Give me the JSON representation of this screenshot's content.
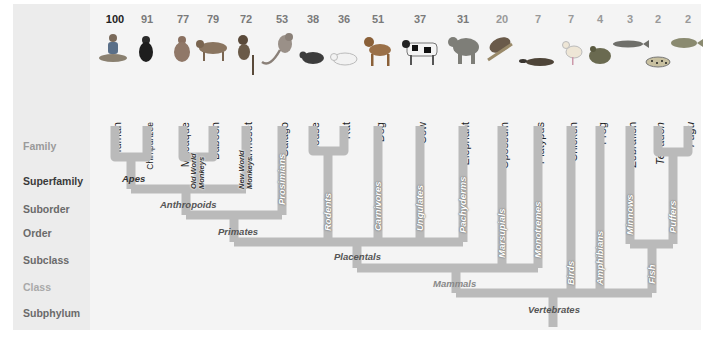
{
  "row_labels": [
    {
      "label": "Family",
      "y": 140,
      "tone": "light-mid"
    },
    {
      "label": "Superfamily",
      "y": 175,
      "tone": "dark"
    },
    {
      "label": "Suborder",
      "y": 203,
      "tone": "mid"
    },
    {
      "label": "Order",
      "y": 227,
      "tone": "mid"
    },
    {
      "label": "Subclass",
      "y": 254,
      "tone": "mid"
    },
    {
      "label": "Class",
      "y": 281,
      "tone": "light"
    },
    {
      "label": "Subphylum",
      "y": 307,
      "tone": "mid"
    }
  ],
  "species": [
    {
      "name": "Human",
      "value": "100",
      "x": 115
    },
    {
      "name": "Chimpanzee",
      "value": "91",
      "x": 147
    },
    {
      "name": "Macaque",
      "value": "77",
      "x": 183
    },
    {
      "name": "Baboon",
      "value": "79",
      "x": 213
    },
    {
      "name": "Marmoset",
      "value": "72",
      "x": 246
    },
    {
      "name": "Galago",
      "value": "53",
      "x": 282
    },
    {
      "name": "Mouse",
      "value": "38",
      "x": 313
    },
    {
      "name": "Rat",
      "value": "36",
      "x": 344
    },
    {
      "name": "Dog",
      "value": "51",
      "x": 378
    },
    {
      "name": "Cow",
      "value": "37",
      "x": 420
    },
    {
      "name": "Elephant",
      "value": "31",
      "x": 463
    },
    {
      "name": "Opossum",
      "value": "20",
      "x": 502
    },
    {
      "name": "Platypus",
      "value": "7",
      "x": 538
    },
    {
      "name": "Chicken",
      "value": "7",
      "x": 571
    },
    {
      "name": "Frog",
      "value": "4",
      "x": 600
    },
    {
      "name": "Zebrafish",
      "value": "3",
      "x": 630
    },
    {
      "name": "Tetradon",
      "value": "2",
      "x": 658
    },
    {
      "name": "Fugu",
      "value": "2",
      "x": 688
    }
  ],
  "clades": {
    "apes": "Apes",
    "old_world_monkeys": [
      "Old World",
      "Monkeys"
    ],
    "new_world_monkeys": [
      "New World",
      "Monkeys"
    ],
    "anthropoids": "Anthropoids",
    "prosimians": "Prosimians",
    "primates": "Primates",
    "rodents": "Rodents",
    "carnivores": "Carnivores",
    "ungulates": "Ungulates",
    "pachyderms": "Pachyderms",
    "placentals": "Placentals",
    "marsupials": "Marsupials",
    "monotremes": "Monotremes",
    "mammals": "Mammals",
    "birds": "Birds",
    "amphibians": "Amphibians",
    "minnows": "Minnows",
    "puffers": "Puffers",
    "fish": "Fish",
    "vertebrates": "Vertebrates"
  },
  "colors": {
    "branch": "#b9b9b9",
    "panel": "#f4f4f4",
    "left_column": "#ececec"
  }
}
